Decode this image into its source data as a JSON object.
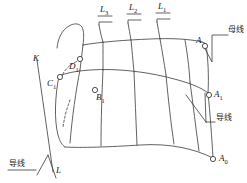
{
  "figure": {
    "type": "engineering-line-diagram",
    "background_color": "#ffffff",
    "line_color": "#3a3a3a",
    "text_color": "#1a1a1a"
  },
  "grid_labels": [
    {
      "id": "L3",
      "text": "L",
      "sub": "3"
    },
    {
      "id": "L2",
      "text": "L",
      "sub": "2"
    },
    {
      "id": "L1",
      "text": "L",
      "sub": "1"
    }
  ],
  "point_labels": [
    {
      "id": "A",
      "text": "A",
      "sub": ""
    },
    {
      "id": "A1",
      "text": "A",
      "sub": "1"
    },
    {
      "id": "A0",
      "text": "A",
      "sub": "0"
    },
    {
      "id": "B1",
      "text": "B",
      "sub": "1"
    },
    {
      "id": "C1",
      "text": "C",
      "sub": "1"
    },
    {
      "id": "D1",
      "text": "D",
      "sub": "1"
    }
  ],
  "line_labels": [
    {
      "id": "K",
      "text": "K"
    },
    {
      "id": "L",
      "text": "L"
    }
  ],
  "annotations": [
    {
      "id": "busbar",
      "text": "母线"
    },
    {
      "id": "conductor-right",
      "text": "导线"
    },
    {
      "id": "conductor-left",
      "text": "导线"
    }
  ]
}
